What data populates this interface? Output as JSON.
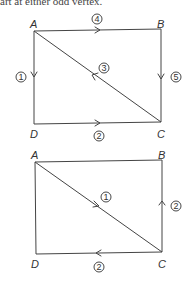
{
  "header": {
    "fragment_text": "art at either odd vertex."
  },
  "diagram1": {
    "vertices": {
      "A": "A",
      "B": "B",
      "C": "C",
      "D": "D"
    },
    "edges": [
      {
        "from": "A",
        "to": "D",
        "order": "1"
      },
      {
        "from": "D",
        "to": "C",
        "order": "2"
      },
      {
        "from": "C",
        "to": "A",
        "order": "3"
      },
      {
        "from": "A",
        "to": "B",
        "order": "4"
      },
      {
        "from": "B",
        "to": "C",
        "order": "5"
      }
    ]
  },
  "diagram2": {
    "vertices": {
      "A": "A",
      "B": "B",
      "C": "C",
      "D": "D"
    },
    "edges": [
      {
        "from": "A",
        "to": "C",
        "order": "1"
      },
      {
        "from": "C",
        "to": "B",
        "order": "2"
      },
      {
        "from": "C",
        "to": "D",
        "order": "2"
      }
    ]
  }
}
